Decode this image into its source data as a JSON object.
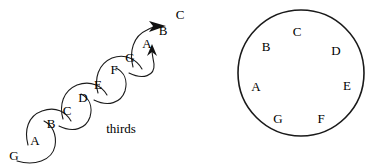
{
  "figure": {
    "width": 381,
    "height": 168,
    "background": "#ffffff",
    "ink": "#000000"
  },
  "left_diagram": {
    "name": "thirds-chain",
    "caption": {
      "text": "thirds",
      "x": 121,
      "y": 128
    },
    "stroke": "#1a1a1a",
    "stroke_width": 1.1,
    "note_labels": [
      {
        "text": "G",
        "x": 14,
        "y": 155
      },
      {
        "text": "A",
        "x": 35,
        "y": 140
      },
      {
        "text": "B",
        "x": 51,
        "y": 123
      },
      {
        "text": "C",
        "x": 67,
        "y": 110
      },
      {
        "text": "D",
        "x": 83,
        "y": 97
      },
      {
        "text": "E",
        "x": 98,
        "y": 84
      },
      {
        "text": "F",
        "x": 114,
        "y": 69
      },
      {
        "text": "G",
        "x": 130,
        "y": 57
      },
      {
        "text": "A",
        "x": 147,
        "y": 43
      },
      {
        "text": "B",
        "x": 163,
        "y": 30
      },
      {
        "text": "C",
        "x": 180,
        "y": 14
      }
    ],
    "arrows": [
      {
        "name": "arrow-to-b",
        "direction": "up-right"
      },
      {
        "name": "arrow-to-a",
        "direction": "up"
      }
    ]
  },
  "right_diagram": {
    "name": "note-circle",
    "circle": {
      "cx": 101,
      "cy": 73,
      "r": 63,
      "stroke": "#1a1a1a",
      "stroke_width": 1.6,
      "fill": "none"
    },
    "note_labels": [
      {
        "text": "A",
        "x": 56,
        "y": 86
      },
      {
        "text": "B",
        "x": 66,
        "y": 46
      },
      {
        "text": "C",
        "x": 97,
        "y": 31
      },
      {
        "text": "D",
        "x": 136,
        "y": 50
      },
      {
        "text": "E",
        "x": 147,
        "y": 85
      },
      {
        "text": "F",
        "x": 121,
        "y": 118
      },
      {
        "text": "G",
        "x": 78,
        "y": 118
      }
    ]
  }
}
